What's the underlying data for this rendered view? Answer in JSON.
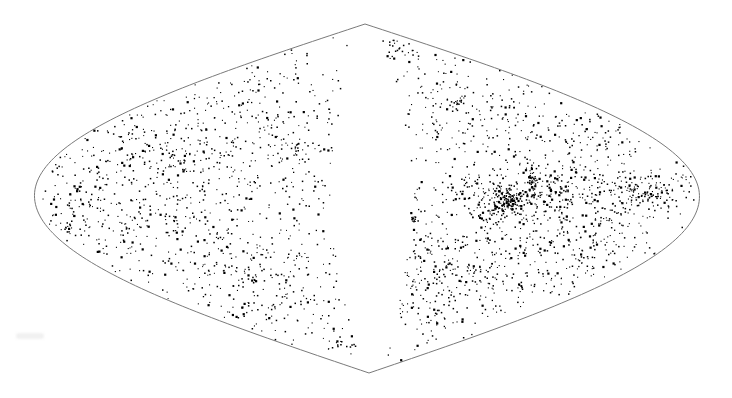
{
  "chart_data": {
    "type": "scatter",
    "title": "",
    "subtitle": "",
    "xlabel": "",
    "ylabel": "",
    "projection": "sinusoidal (Sanson-Flamsteed) all-sky",
    "grid": false,
    "legend": null,
    "point_color": "#000000",
    "outline_color": "#7a7a7a",
    "background": "#ffffff",
    "outline": {
      "top": [
        365,
        24
      ],
      "bottom": [
        369,
        373
      ],
      "left": [
        37,
        199
      ],
      "right": [
        702,
        193
      ]
    },
    "zone_of_avoidance": "empty band running from top apex to bottom apex through the center",
    "clusters": [
      {
        "name": "left-upper-arc",
        "cx": 150,
        "cy": 150,
        "sx": 60,
        "sy": 28,
        "n": 220
      },
      {
        "name": "left-upper-2",
        "cx": 250,
        "cy": 140,
        "sx": 50,
        "sy": 35,
        "n": 150
      },
      {
        "name": "left-top-band",
        "cx": 280,
        "cy": 95,
        "sx": 40,
        "sy": 25,
        "n": 60
      },
      {
        "name": "left-edge-mid",
        "cx": 90,
        "cy": 205,
        "sx": 28,
        "sy": 22,
        "n": 110
      },
      {
        "name": "left-mid",
        "cx": 170,
        "cy": 220,
        "sx": 45,
        "sy": 25,
        "n": 150
      },
      {
        "name": "left-lower-arc",
        "cx": 240,
        "cy": 270,
        "sx": 55,
        "sy": 18,
        "n": 160
      },
      {
        "name": "left-bottom",
        "cx": 280,
        "cy": 315,
        "sx": 45,
        "sy": 14,
        "n": 70
      },
      {
        "name": "left-bottom-tip",
        "cx": 340,
        "cy": 345,
        "sx": 10,
        "sy": 6,
        "n": 18
      },
      {
        "name": "left-sparse-mid",
        "cx": 320,
        "cy": 210,
        "sx": 25,
        "sy": 45,
        "n": 35
      },
      {
        "name": "right-top-tip",
        "cx": 395,
        "cy": 50,
        "sx": 15,
        "sy": 15,
        "n": 30
      },
      {
        "name": "right-upper",
        "cx": 460,
        "cy": 110,
        "sx": 45,
        "sy": 30,
        "n": 140
      },
      {
        "name": "right-upper-2",
        "cx": 560,
        "cy": 140,
        "sx": 50,
        "sy": 25,
        "n": 170
      },
      {
        "name": "right-great-band",
        "cx": 560,
        "cy": 195,
        "sx": 90,
        "sy": 14,
        "n": 420
      },
      {
        "name": "right-core",
        "cx": 505,
        "cy": 203,
        "sx": 10,
        "sy": 6,
        "n": 120
      },
      {
        "name": "right-filament",
        "cx": 533,
        "cy": 182,
        "sx": 4,
        "sy": 10,
        "n": 50
      },
      {
        "name": "right-east-tail",
        "cx": 650,
        "cy": 190,
        "sx": 25,
        "sy": 8,
        "n": 70
      },
      {
        "name": "right-lower",
        "cx": 500,
        "cy": 250,
        "sx": 60,
        "sy": 25,
        "n": 230
      },
      {
        "name": "right-lower-2",
        "cx": 440,
        "cy": 280,
        "sx": 40,
        "sy": 25,
        "n": 130
      },
      {
        "name": "right-lower-3",
        "cx": 580,
        "cy": 250,
        "sx": 40,
        "sy": 20,
        "n": 110
      },
      {
        "name": "right-bottom",
        "cx": 420,
        "cy": 320,
        "sx": 25,
        "sy": 18,
        "n": 40
      },
      {
        "name": "right-knot-1",
        "cx": 413,
        "cy": 219,
        "sx": 2,
        "sy": 3,
        "n": 14
      },
      {
        "name": "right-knot-2",
        "cx": 522,
        "cy": 287,
        "sx": 3,
        "sy": 2,
        "n": 12
      },
      {
        "name": "right-knot-3",
        "cx": 458,
        "cy": 102,
        "sx": 4,
        "sy": 3,
        "n": 14
      },
      {
        "name": "left-knot-1",
        "cx": 68,
        "cy": 228,
        "sx": 3,
        "sy": 2,
        "n": 10
      },
      {
        "name": "left-knot-2",
        "cx": 255,
        "cy": 280,
        "sx": 3,
        "sy": 2,
        "n": 10
      },
      {
        "name": "left-knot-3",
        "cx": 298,
        "cy": 148,
        "sx": 3,
        "sy": 3,
        "n": 10
      }
    ],
    "uniform_background_points": 320,
    "random_seed": 7
  }
}
